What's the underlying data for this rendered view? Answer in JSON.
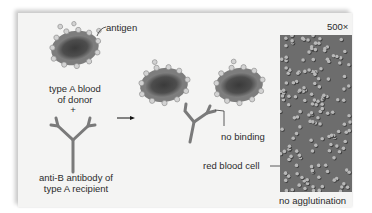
{
  "labels": {
    "antigen": "antigen",
    "donor_line1": "type A blood",
    "donor_line2": "of donor",
    "plus": "+",
    "antibody_line1": "anti-B antibody of",
    "antibody_line2": "type A recipient",
    "no_binding": "no binding",
    "red_blood_cell": "red blood cell",
    "magnification": "500×",
    "no_agglutination": "no agglutination"
  },
  "colors": {
    "cell_body": "#4a4a4a",
    "cell_rim": "#8a8a8a",
    "antigen_dot": "#cfcfcf",
    "antibody": "#7a7a7a",
    "photo_bg": "#6d6d6d"
  }
}
